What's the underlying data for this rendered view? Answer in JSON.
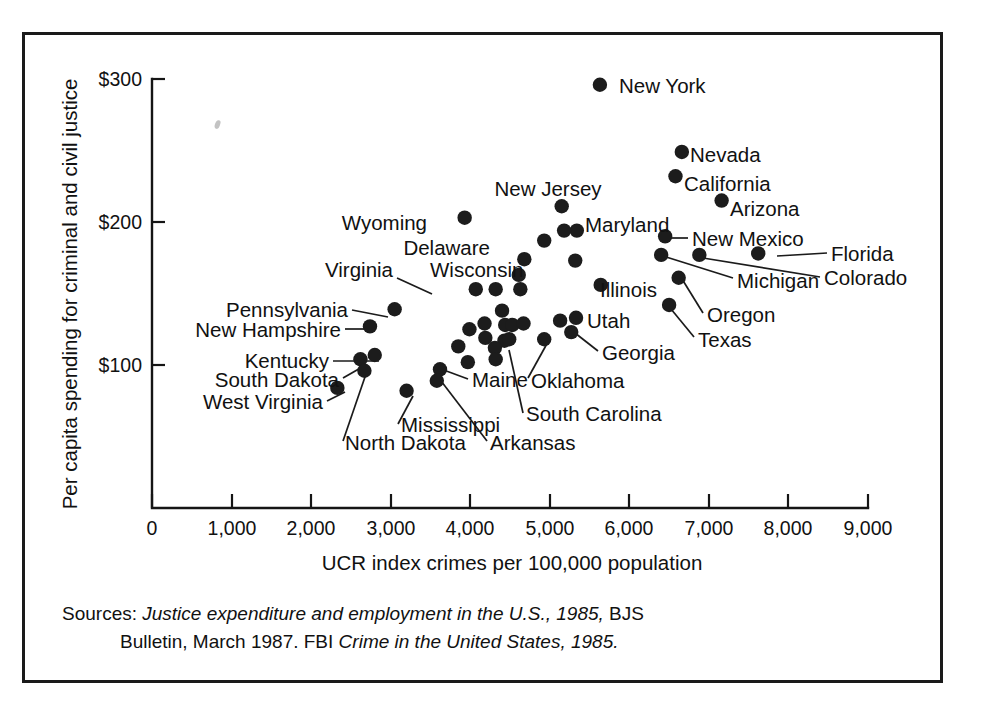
{
  "figure": {
    "title": "",
    "sources_prefix": "Sources:",
    "sources_line1_italic": "Justice expenditure and employment in the U.S., 1985,",
    "sources_line1_roman": " BJS",
    "sources_line2_roman_a": "Bulletin, March 1987. FBI ",
    "sources_line2_italic": "Crime in the United States, 1985.",
    "ink_color": "#1c1c1c",
    "paper_color": "#ffffff",
    "smudge_note": "faint scan artifact"
  },
  "chart_data": {
    "type": "scatter",
    "title": "",
    "xlabel": "UCR index crimes per 100,000 population",
    "ylabel": "Per capita spending for criminal and civil justice",
    "xlim": [
      0,
      9000
    ],
    "ylim": [
      0,
      300
    ],
    "xticks": [
      0,
      1000,
      2000,
      3000,
      4000,
      5000,
      6000,
      7000,
      8000,
      9000
    ],
    "xticklabels": [
      "0",
      "1,000",
      "2,000",
      "3,000",
      "4,000",
      "5,000",
      "6,000",
      "7,000",
      "8,000",
      "9,000"
    ],
    "yticks": [
      100,
      200,
      300
    ],
    "yticklabels": [
      "$100",
      "$200",
      "$300"
    ],
    "grid": false,
    "legend": false,
    "points": [
      {
        "label": "New York",
        "x": 5630,
        "y": 296,
        "labeled": true,
        "label_pos": "right"
      },
      {
        "label": "Nevada",
        "x": 6660,
        "y": 249,
        "labeled": true,
        "label_pos": "right"
      },
      {
        "label": "California",
        "x": 6580,
        "y": 232,
        "labeled": true,
        "label_pos": "right"
      },
      {
        "label": "Arizona",
        "x": 7160,
        "y": 215,
        "labeled": true,
        "label_pos": "right"
      },
      {
        "label": "New Jersey",
        "x": 5150,
        "y": 211,
        "labeled": true,
        "label_pos": "above"
      },
      {
        "label": "Wyoming",
        "x": 3930,
        "y": 203,
        "labeled": true,
        "label_pos": "left"
      },
      {
        "label": "Maryland",
        "x": 5340,
        "y": 194,
        "labeled": true,
        "label_pos": "right"
      },
      {
        "label": "Maryland-pair",
        "x": 5180,
        "y": 194,
        "labeled": false,
        "label_pos": ""
      },
      {
        "label": "New Mexico",
        "x": 6450,
        "y": 190,
        "labeled": true,
        "label_pos": "leader-right"
      },
      {
        "label": "Delaware",
        "x": 4930,
        "y": 187,
        "labeled": true,
        "label_pos": "left"
      },
      {
        "label": "Florida",
        "x": 7620,
        "y": 178,
        "labeled": true,
        "label_pos": "leader-right"
      },
      {
        "label": "Michigan",
        "x": 6400,
        "y": 177,
        "labeled": true,
        "label_pos": "leader-right"
      },
      {
        "label": "Colorado",
        "x": 6880,
        "y": 177,
        "labeled": true,
        "label_pos": "leader-right"
      },
      {
        "label": "unlabeled-a",
        "x": 5320,
        "y": 173,
        "labeled": false,
        "label_pos": ""
      },
      {
        "label": "unlabeled-b",
        "x": 4680,
        "y": 174,
        "labeled": false,
        "label_pos": ""
      },
      {
        "label": "Wisconsin",
        "x": 4610,
        "y": 163,
        "labeled": true,
        "label_pos": "left"
      },
      {
        "label": "Oregon",
        "x": 6620,
        "y": 161,
        "labeled": true,
        "label_pos": "leader-right"
      },
      {
        "label": "Illinois",
        "x": 5640,
        "y": 156,
        "labeled": true,
        "label_pos": "right"
      },
      {
        "label": "Virginia",
        "x": 4070,
        "y": 153,
        "labeled": true,
        "label_pos": "leader-left"
      },
      {
        "label": "unlabeled-c",
        "x": 4320,
        "y": 153,
        "labeled": false,
        "label_pos": ""
      },
      {
        "label": "unlabeled-d",
        "x": 4630,
        "y": 153,
        "labeled": false,
        "label_pos": ""
      },
      {
        "label": "Texas",
        "x": 6500,
        "y": 142,
        "labeled": true,
        "label_pos": "leader-right"
      },
      {
        "label": "Pennsylvania",
        "x": 3050,
        "y": 139,
        "labeled": true,
        "label_pos": "leader-left"
      },
      {
        "label": "unlabeled-e",
        "x": 4400,
        "y": 138,
        "labeled": false,
        "label_pos": ""
      },
      {
        "label": "Utah",
        "x": 5330,
        "y": 133,
        "labeled": true,
        "label_pos": "right"
      },
      {
        "label": "unlabeled-f",
        "x": 5130,
        "y": 131,
        "labeled": false,
        "label_pos": ""
      },
      {
        "label": "New Hampshire",
        "x": 2740,
        "y": 127,
        "labeled": true,
        "label_pos": "leader-left"
      },
      {
        "label": "unlabeled-g",
        "x": 4180,
        "y": 129,
        "labeled": false,
        "label_pos": ""
      },
      {
        "label": "unlabeled-h",
        "x": 4440,
        "y": 128,
        "labeled": false,
        "label_pos": ""
      },
      {
        "label": "unlabeled-i",
        "x": 4530,
        "y": 128,
        "labeled": false,
        "label_pos": ""
      },
      {
        "label": "unlabeled-j",
        "x": 4670,
        "y": 129,
        "labeled": false,
        "label_pos": ""
      },
      {
        "label": "unlabeled-k",
        "x": 3990,
        "y": 125,
        "labeled": false,
        "label_pos": ""
      },
      {
        "label": "Georgia",
        "x": 5270,
        "y": 123,
        "labeled": true,
        "label_pos": "leader-right"
      },
      {
        "label": "unlabeled-l",
        "x": 4190,
        "y": 119,
        "labeled": false,
        "label_pos": ""
      },
      {
        "label": "unlabeled-m",
        "x": 4430,
        "y": 117,
        "labeled": false,
        "label_pos": ""
      },
      {
        "label": "Oklahoma",
        "x": 4930,
        "y": 118,
        "labeled": true,
        "label_pos": "leader-right"
      },
      {
        "label": "unlabeled-n",
        "x": 3850,
        "y": 113,
        "labeled": false,
        "label_pos": ""
      },
      {
        "label": "unlabeled-o",
        "x": 4310,
        "y": 112,
        "labeled": false,
        "label_pos": ""
      },
      {
        "label": "unlabeled-p",
        "x": 4320,
        "y": 104,
        "labeled": false,
        "label_pos": ""
      },
      {
        "label": "Kentucky",
        "x": 2800,
        "y": 107,
        "labeled": true,
        "label_pos": "leader-left"
      },
      {
        "label": "unlabeled-q",
        "x": 3970,
        "y": 102,
        "labeled": false,
        "label_pos": ""
      },
      {
        "label": "South Dakota",
        "x": 2620,
        "y": 104,
        "labeled": true,
        "label_pos": "leader-left"
      },
      {
        "label": "North Dakota",
        "x": 2670,
        "y": 96,
        "labeled": true,
        "label_pos": "leader-down"
      },
      {
        "label": "Maine",
        "x": 3620,
        "y": 97,
        "labeled": true,
        "label_pos": "leader-right"
      },
      {
        "label": "Arkansas",
        "x": 3580,
        "y": 89,
        "labeled": true,
        "label_pos": "leader-down"
      },
      {
        "label": "West Virginia",
        "x": 2330,
        "y": 84,
        "labeled": true,
        "label_pos": "leader-left"
      },
      {
        "label": "Mississippi",
        "x": 3200,
        "y": 82,
        "labeled": true,
        "label_pos": "leader-down"
      },
      {
        "label": "South Carolina",
        "x": 4490,
        "y": 118,
        "labeled": true,
        "label_pos": "leader-down"
      }
    ]
  }
}
